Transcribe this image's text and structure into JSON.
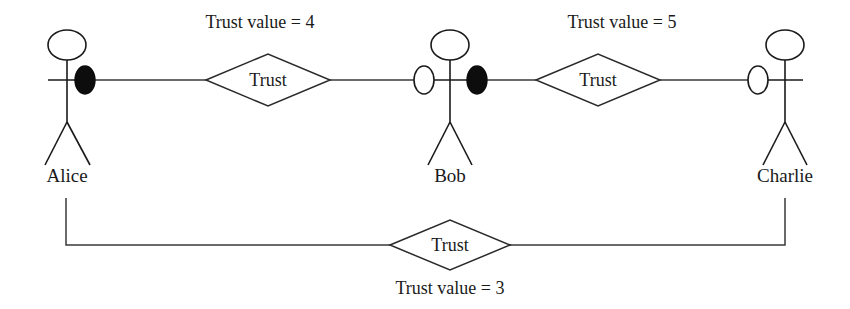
{
  "diagram": {
    "colors": {
      "line": "#1a1a1a",
      "filled_endpoint": "#0d0d0d",
      "hollow_endpoint": "#ffffff",
      "background": "#ffffff"
    },
    "actors": [
      {
        "id": "alice",
        "name": "Alice"
      },
      {
        "id": "bob",
        "name": "Bob"
      },
      {
        "id": "charlie",
        "name": "Charlie"
      }
    ],
    "relationships": [
      {
        "id": "alice-bob",
        "label": "Trust",
        "value_label": "Trust value = 4",
        "value": 4,
        "from": "Alice",
        "to": "Bob"
      },
      {
        "id": "bob-charlie",
        "label": "Trust",
        "value_label": "Trust value = 5",
        "value": 5,
        "from": "Bob",
        "to": "Charlie"
      },
      {
        "id": "alice-charlie",
        "label": "Trust",
        "value_label": "Trust value = 3",
        "value": 3,
        "from": "Alice",
        "to": "Charlie"
      }
    ]
  }
}
